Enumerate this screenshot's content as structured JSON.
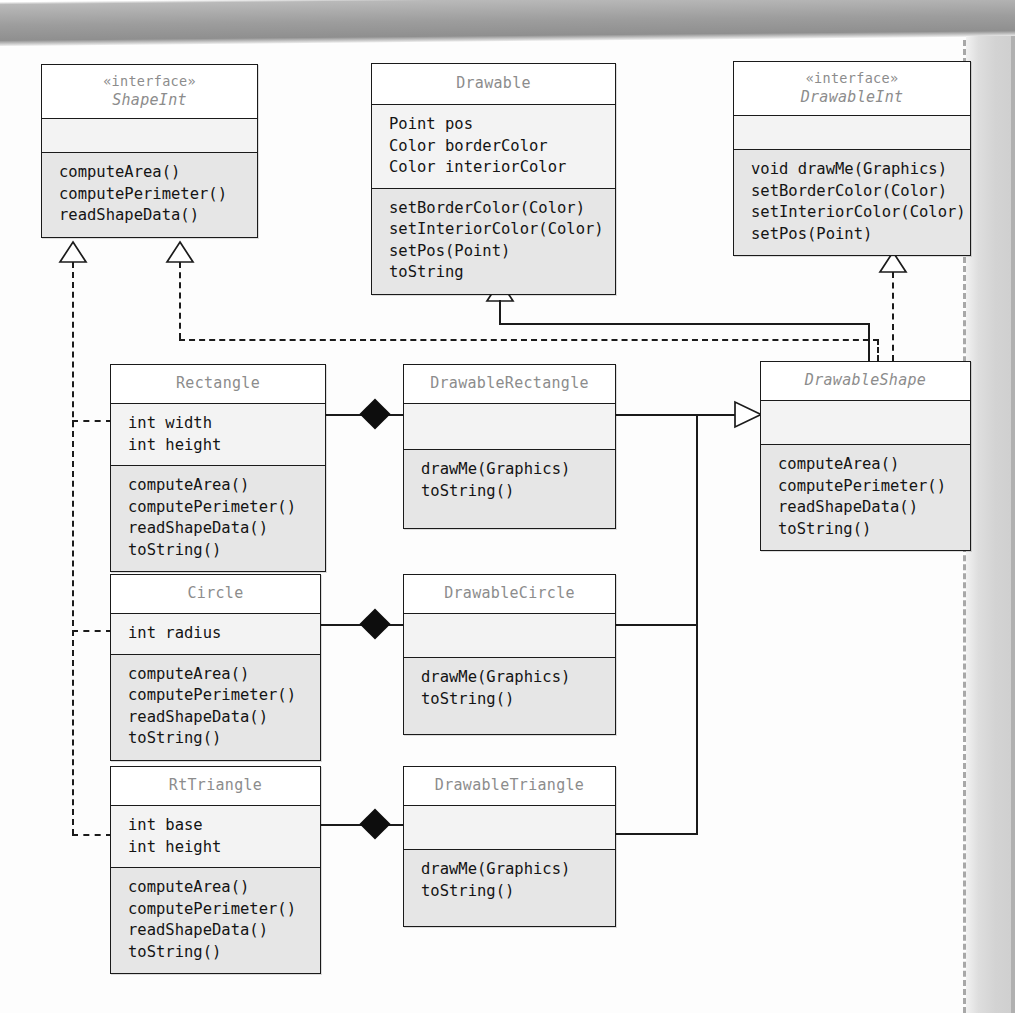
{
  "diagram": {
    "kind": "uml-class-diagram",
    "classes": [
      {
        "id": "shapeint",
        "stereotype": "«interface»",
        "name": "ShapeInt",
        "abstract": true,
        "attributes": [],
        "operations": [
          "computeArea()",
          "computePerimeter()",
          "readShapeData()"
        ]
      },
      {
        "id": "drawable",
        "stereotype": "",
        "name": "Drawable",
        "abstract": false,
        "attributes": [
          "Point pos",
          "Color borderColor",
          "Color interiorColor"
        ],
        "operations": [
          "setBorderColor(Color)",
          "setInteriorColor(Color)",
          "setPos(Point)",
          "toString"
        ]
      },
      {
        "id": "drawableint",
        "stereotype": "«interface»",
        "name": "DrawableInt",
        "abstract": true,
        "attributes": [],
        "operations": [
          "void drawMe(Graphics)",
          "setBorderColor(Color)",
          "setInteriorColor(Color)",
          "setPos(Point)"
        ]
      },
      {
        "id": "rectangle",
        "stereotype": "",
        "name": "Rectangle",
        "abstract": false,
        "attributes": [
          "int width",
          "int height"
        ],
        "operations": [
          "computeArea()",
          "computePerimeter()",
          "readShapeData()",
          "toString()"
        ]
      },
      {
        "id": "drawablerectangle",
        "stereotype": "",
        "name": "DrawableRectangle",
        "abstract": false,
        "attributes": [],
        "operations": [
          "drawMe(Graphics)",
          "toString()"
        ]
      },
      {
        "id": "drawableshape",
        "stereotype": "",
        "name": "DrawableShape",
        "abstract": true,
        "attributes": [],
        "operations": [
          "computeArea()",
          "computePerimeter()",
          "readShapeData()",
          "toString()"
        ]
      },
      {
        "id": "circle",
        "stereotype": "",
        "name": "Circle",
        "abstract": false,
        "attributes": [
          "int radius"
        ],
        "operations": [
          "computeArea()",
          "computePerimeter()",
          "readShapeData()",
          "toString()"
        ]
      },
      {
        "id": "drawablecircle",
        "stereotype": "",
        "name": "DrawableCircle",
        "abstract": false,
        "attributes": [],
        "operations": [
          "drawMe(Graphics)",
          "toString()"
        ]
      },
      {
        "id": "rttriangle",
        "stereotype": "",
        "name": "RtTriangle",
        "abstract": false,
        "attributes": [
          "int base",
          "int height"
        ],
        "operations": [
          "computeArea()",
          "computePerimeter()",
          "readShapeData()",
          "toString()"
        ]
      },
      {
        "id": "drawabletriangle",
        "stereotype": "",
        "name": "DrawableTriangle",
        "abstract": false,
        "attributes": [],
        "operations": [
          "drawMe(Graphics)",
          "toString()"
        ]
      }
    ],
    "relationships": [
      {
        "type": "realization",
        "from": "Rectangle",
        "to": "ShapeInt",
        "style": "dashed-hollow-triangle"
      },
      {
        "type": "realization",
        "from": "Circle",
        "to": "ShapeInt",
        "style": "dashed-hollow-triangle"
      },
      {
        "type": "realization",
        "from": "RtTriangle",
        "to": "ShapeInt",
        "style": "dashed-hollow-triangle"
      },
      {
        "type": "realization",
        "from": "DrawableShape",
        "to": "ShapeInt",
        "style": "dashed-hollow-triangle"
      },
      {
        "type": "realization",
        "from": "DrawableShape",
        "to": "DrawableInt",
        "style": "dashed-hollow-triangle"
      },
      {
        "type": "generalization",
        "from": "DrawableShape",
        "to": "Drawable",
        "style": "solid-hollow-triangle"
      },
      {
        "type": "generalization",
        "from": "DrawableRectangle",
        "to": "DrawableShape",
        "style": "solid-hollow-triangle"
      },
      {
        "type": "generalization",
        "from": "DrawableCircle",
        "to": "DrawableShape",
        "style": "solid-hollow-triangle"
      },
      {
        "type": "generalization",
        "from": "DrawableTriangle",
        "to": "DrawableShape",
        "style": "solid-hollow-triangle"
      },
      {
        "type": "composition",
        "from": "DrawableRectangle",
        "to": "Rectangle",
        "style": "filled-diamond"
      },
      {
        "type": "composition",
        "from": "DrawableCircle",
        "to": "Circle",
        "style": "filled-diamond"
      },
      {
        "type": "composition",
        "from": "DrawableTriangle",
        "to": "RtTriangle",
        "style": "filled-diamond"
      }
    ],
    "colors": {
      "box_border": "#1a1a1a",
      "attr_compartment": "#f3f3f3",
      "op_compartment": "#e6e6e6",
      "class_name": "#8c8c8c",
      "member_text": "#141414",
      "connector": "#1b1b1b"
    }
  }
}
